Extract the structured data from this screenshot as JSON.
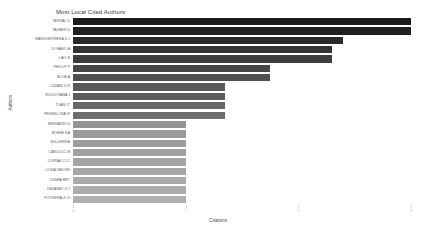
{
  "chart_data": {
    "type": "bar",
    "orientation": "horizontal",
    "title": "Most Local Cited Authors",
    "xlabel": "Citations",
    "ylabel": "Authors",
    "xlim": [
      0,
      3
    ],
    "xticks": [
      0,
      1,
      2,
      3
    ],
    "xtick_labels": [
      "0",
      "1",
      "2",
      "3"
    ],
    "grid": false,
    "legend": false,
    "categories": [
      "SEKRAL D",
      "TAUBER D",
      "RAVIKUMITHERA D J",
      "DI FABIO A",
      "LIAO B",
      "PHILLIP P",
      "BLOM A",
      "LIZZANI D R",
      "ROLDOYAMA J",
      "TUAN LT",
      "PEDRELLINA VI",
      "BERNARDI G",
      "BOHNE RA",
      "BULLERIRA",
      "CARLUCCI B",
      "CORNACCI C",
      "COSALTAS RM",
      "CUNHA MRT",
      "DEKANEZ G J",
      "FITZGERALD G"
    ],
    "values": [
      3.0,
      3.0,
      2.4,
      2.3,
      2.3,
      1.75,
      1.75,
      1.35,
      1.35,
      1.35,
      1.35,
      1.0,
      1.0,
      1.0,
      1.0,
      1.0,
      1.0,
      1.0,
      1.0,
      1.0
    ],
    "bar_colors": [
      "#1b1b1b",
      "#202020",
      "#2a2a2a",
      "#333333",
      "#3d3d3d",
      "#474747",
      "#4f4f4f",
      "#595959",
      "#5f5f5f",
      "#666666",
      "#6d6d6d",
      "#949494",
      "#9a9a9a",
      "#9e9e9e",
      "#a1a1a1",
      "#a4a4a4",
      "#a7a7a7",
      "#aaaaaa",
      "#adadad",
      "#b0b0b0"
    ]
  },
  "colors": {
    "background": "#ffffff",
    "title_text": "#3a3a3a",
    "axis_text": "#4a4a4a",
    "tick_text": "#c9c9c9",
    "category_text": "#565656"
  }
}
